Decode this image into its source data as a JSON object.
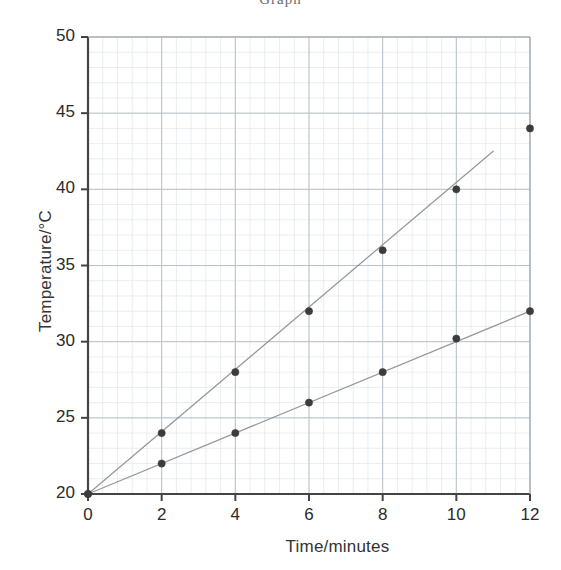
{
  "figure": {
    "clipped_header_text": "Graph",
    "background_color": "#ffffff"
  },
  "chart_data": {
    "type": "scatter",
    "title": "",
    "xlabel": "Time/minutes",
    "ylabel": "Temperature/°C",
    "xlim": [
      0,
      12
    ],
    "ylim": [
      20,
      50
    ],
    "xticks": [
      0,
      2,
      4,
      6,
      8,
      10,
      12
    ],
    "yticks": [
      20,
      25,
      30,
      35,
      40,
      45,
      50
    ],
    "xtick_labels": [
      "0",
      "2",
      "4",
      "6",
      "8",
      "10",
      "12"
    ],
    "ytick_labels": [
      "20",
      "25",
      "30",
      "35",
      "40",
      "45",
      "50"
    ],
    "grid": true,
    "grid_major_color": "#b9c2c8",
    "grid_minor_color": "#dfe5e9",
    "legend": "none",
    "marker_color": "#3c3c3c",
    "line_color": "#8f8f8f",
    "series": [
      {
        "name": "upper",
        "x": [
          0,
          2,
          4,
          6,
          8,
          10,
          12
        ],
        "y": [
          20,
          24,
          28,
          32,
          36,
          40,
          44
        ],
        "line_points": [
          [
            0,
            20
          ],
          [
            11,
            42.5
          ]
        ],
        "line_style": "solid-thin",
        "marker_at_12_on_line": false
      },
      {
        "name": "lower",
        "x": [
          0,
          2,
          4,
          6,
          8,
          10,
          12
        ],
        "y": [
          20,
          22,
          24,
          26,
          28,
          30.2,
          32
        ],
        "line_points": [
          [
            0,
            20
          ],
          [
            12,
            32
          ]
        ],
        "line_style": "solid-thin",
        "marker_at_12_on_line": true
      }
    ]
  },
  "axes_geometry": {
    "plot_left_px": 88,
    "plot_right_px": 530,
    "plot_top_px": 37,
    "plot_bottom_px": 494
  }
}
